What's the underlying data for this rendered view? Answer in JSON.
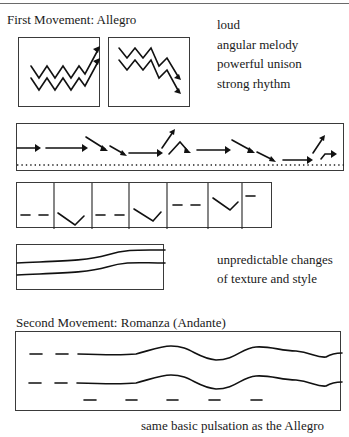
{
  "sections": {
    "first": {
      "title": "First Movement:  Allegro",
      "descriptors": [
        "loud",
        "angular melody",
        "powerful unison",
        "strong rhythm"
      ],
      "texture_note": [
        "unpredictable changes",
        "of texture and style"
      ]
    },
    "second": {
      "title": "Second Movement: Romanza (Andante)",
      "note": "same basic pulsation as the Allegro"
    }
  },
  "figures": [
    {
      "id": "rising-zigzag",
      "description": "two parallel zigzag lines ending in upward arrows"
    },
    {
      "id": "falling-zigzag",
      "description": "two parallel zigzag lines descending with downward arrows"
    },
    {
      "id": "arrow-rhythm-strip",
      "description": "sequence of horizontal and angled arrows above a dotted line"
    },
    {
      "id": "dash-vee-strip",
      "description": "alternating paired dashes and V shapes separated by vertical bars"
    },
    {
      "id": "texture-lines",
      "description": "two parallel curving lines rising to the right"
    },
    {
      "id": "romanza-wave",
      "description": "two wavy lines preceded by dashes, with a row of dashes below"
    }
  ]
}
